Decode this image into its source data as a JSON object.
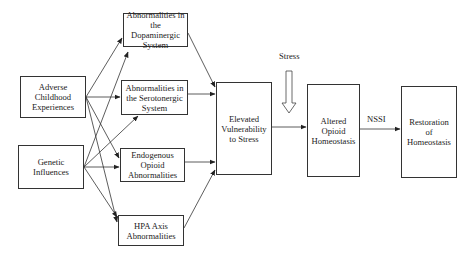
{
  "diagram": {
    "type": "flow",
    "nodes": {
      "adverse": {
        "label": "Adverse Childhood Experiences"
      },
      "genetic": {
        "label": "Genetic Influences"
      },
      "dopaminergic": {
        "label": "Abnormalities in the Dopaminergic System"
      },
      "serotonergic": {
        "label": "Abnormalities in the Serotonergic System"
      },
      "opioid": {
        "label": "Endogenous Opioid Abnormalities"
      },
      "hpa": {
        "label": "HPA Axis Abnormalities"
      },
      "vulnerability": {
        "label": "Elevated Vulnerability to Stress"
      },
      "altered": {
        "label": "Altered Opioid Homeostasis"
      },
      "restoration": {
        "label": "Restoration of Homeostasis"
      }
    },
    "annotations": {
      "stress": "Stress",
      "nssi": "NSSI"
    },
    "edges": [
      {
        "from": "Adverse Childhood Experiences",
        "to": "Abnormalities in the Dopaminergic System"
      },
      {
        "from": "Adverse Childhood Experiences",
        "to": "Abnormalities in the Serotonergic System"
      },
      {
        "from": "Adverse Childhood Experiences",
        "to": "Endogenous Opioid Abnormalities"
      },
      {
        "from": "Adverse Childhood Experiences",
        "to": "HPA Axis Abnormalities"
      },
      {
        "from": "Genetic Influences",
        "to": "Abnormalities in the Dopaminergic System"
      },
      {
        "from": "Genetic Influences",
        "to": "Abnormalities in the Serotonergic System"
      },
      {
        "from": "Genetic Influences",
        "to": "Endogenous Opioid Abnormalities"
      },
      {
        "from": "Genetic Influences",
        "to": "HPA Axis Abnormalities"
      },
      {
        "from": "Abnormalities in the Dopaminergic System",
        "to": "Elevated Vulnerability to Stress"
      },
      {
        "from": "Abnormalities in the Serotonergic System",
        "to": "Elevated Vulnerability to Stress"
      },
      {
        "from": "Endogenous Opioid Abnormalities",
        "to": "Elevated Vulnerability to Stress"
      },
      {
        "from": "HPA Axis Abnormalities",
        "to": "Elevated Vulnerability to Stress"
      },
      {
        "from": "Elevated Vulnerability to Stress",
        "to": "Altered Opioid Homeostasis"
      },
      {
        "from": "Stress",
        "to": "Elevated Vulnerability to Stress → Altered Opioid Homeostasis",
        "style": "hollow-arrow"
      },
      {
        "from": "Altered Opioid Homeostasis",
        "to": "Restoration of Homeostasis",
        "label": "NSSI"
      }
    ]
  }
}
